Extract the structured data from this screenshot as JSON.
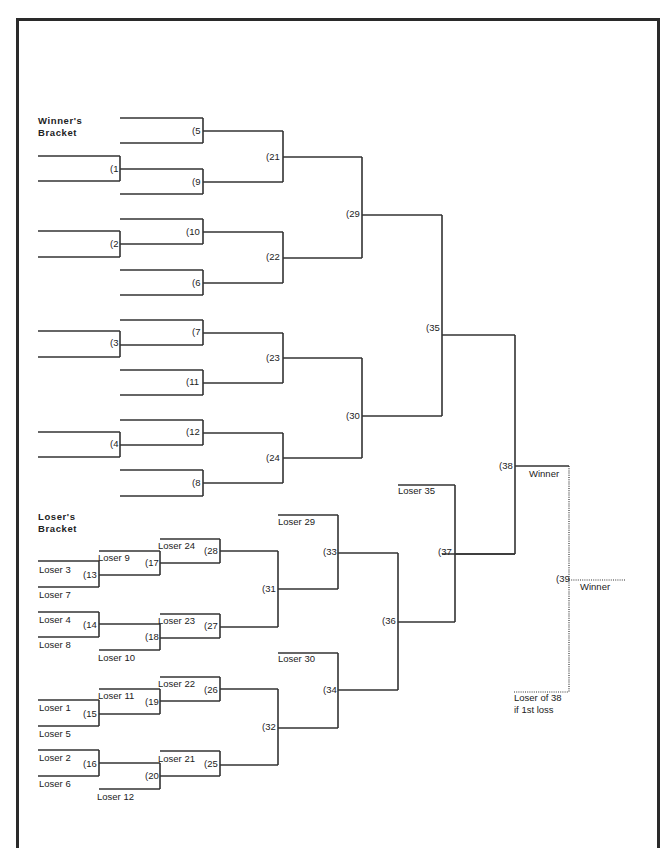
{
  "diagram": {
    "type": "double-elimination tournament bracket",
    "winners_bracket_heading": [
      "Winner's",
      "Bracket"
    ],
    "losers_bracket_heading": [
      "Loser's",
      "Bracket"
    ]
  },
  "games": {
    "g1": "(1",
    "g2": "(2",
    "g3": "(3",
    "g4": "(4",
    "g5": "(5",
    "g6": "(6",
    "g7": "(7",
    "g8": "(8",
    "g9": "(9",
    "g10": "(10",
    "g11": "(11",
    "g12": "(12",
    "g13": "(13",
    "g14": "(14",
    "g15": "(15",
    "g16": "(16",
    "g17": "(17",
    "g18": "(18",
    "g19": "(19",
    "g20": "(20",
    "g21": "(21",
    "g22": "(22",
    "g23": "(23",
    "g24": "(24",
    "g25": "(25",
    "g26": "(26",
    "g27": "(27",
    "g28": "(28",
    "g29": "(29",
    "g30": "(30",
    "g31": "(31",
    "g32": "(32",
    "g33": "(33",
    "g34": "(34",
    "g35": "(35",
    "g36": "(36",
    "g37": "(37",
    "g38": "(38",
    "g39": "(39"
  },
  "slot_labels": {
    "loser3": "Loser 3",
    "loser7": "Loser 7",
    "loser9": "Loser 9",
    "loser24": "Loser 24",
    "loser4": "Loser 4",
    "loser8": "Loser 8",
    "loser10": "Loser 10",
    "loser23": "Loser 23",
    "loser1": "Loser 1",
    "loser5": "Loser 5",
    "loser11": "Loser 11",
    "loser22": "Loser 22",
    "loser2": "Loser 2",
    "loser6": "Loser 6",
    "loser12": "Loser 12",
    "loser21": "Loser 21",
    "loser29": "Loser 29",
    "loser30": "Loser 30",
    "loser35": "Loser 35",
    "winner38": "Winner",
    "winner39": "Winner",
    "loser38_line1": "Loser of 38",
    "loser38_line2": "if 1st loss"
  }
}
